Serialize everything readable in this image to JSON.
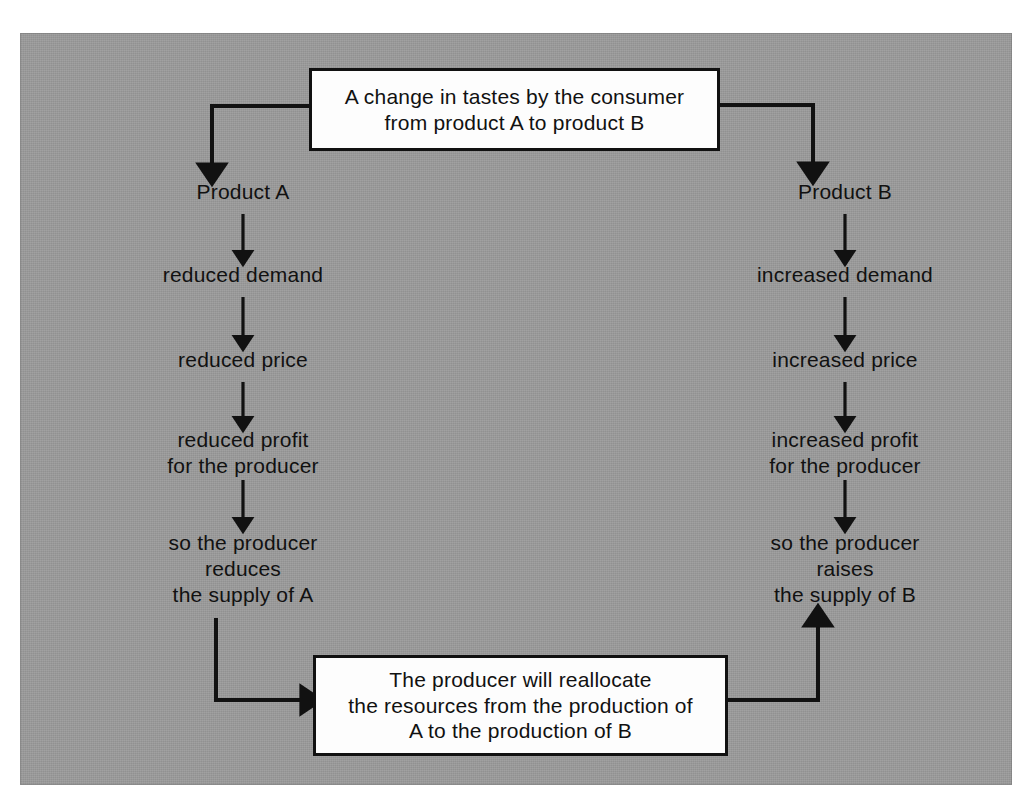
{
  "diagram": {
    "title_box": {
      "id": "change-in-tastes-box",
      "lines": [
        "A change in tastes by the consumer",
        "from product A to product B"
      ]
    },
    "bottom_box": {
      "id": "reallocate-resources-box",
      "lines": [
        "The producer will reallocate",
        "the resources from the production of",
        "A to the production of B"
      ]
    },
    "left_branch": {
      "name": "product-a-branch",
      "nodes": [
        {
          "id": "product-a",
          "text": "Product A"
        },
        {
          "id": "reduced-demand",
          "text": "reduced demand"
        },
        {
          "id": "reduced-price",
          "text": "reduced price"
        },
        {
          "id": "reduced-profit",
          "text": "reduced profit\nfor the producer"
        },
        {
          "id": "producer-reduces-supply",
          "text": "so the producer\nreduces\nthe supply of A"
        }
      ]
    },
    "right_branch": {
      "name": "product-b-branch",
      "nodes": [
        {
          "id": "product-b",
          "text": "Product B"
        },
        {
          "id": "increased-demand",
          "text": "increased demand"
        },
        {
          "id": "increased-price",
          "text": "increased price"
        },
        {
          "id": "increased-profit",
          "text": "increased profit\nfor the producer"
        },
        {
          "id": "producer-raises-supply",
          "text": "so the producer\nraises\nthe supply of B"
        }
      ]
    },
    "connectors": [
      {
        "id": "top-box-to-product-a",
        "direction": "down",
        "arrowhead": true
      },
      {
        "id": "top-box-to-product-b",
        "direction": "down",
        "arrowhead": true
      },
      {
        "id": "product-a-to-reduced-demand",
        "direction": "down",
        "arrowhead": true
      },
      {
        "id": "reduced-demand-to-reduced-price",
        "direction": "down",
        "arrowhead": true
      },
      {
        "id": "reduced-price-to-reduced-profit",
        "direction": "down",
        "arrowhead": true
      },
      {
        "id": "reduced-profit-to-reduces-supply",
        "direction": "down",
        "arrowhead": true
      },
      {
        "id": "product-b-to-increased-demand",
        "direction": "down",
        "arrowhead": true
      },
      {
        "id": "increased-demand-to-increased-price",
        "direction": "down",
        "arrowhead": true
      },
      {
        "id": "increased-price-to-increased-profit",
        "direction": "down",
        "arrowhead": true
      },
      {
        "id": "increased-profit-to-raises-supply",
        "direction": "down",
        "arrowhead": true
      },
      {
        "id": "reduces-supply-to-bottom-box",
        "direction": "right",
        "arrowhead": true
      },
      {
        "id": "bottom-box-to-raises-supply",
        "direction": "up",
        "arrowhead": true
      }
    ],
    "colors": {
      "panel_background": "#9b9b9b",
      "box_fill": "#fdfdfd",
      "ink": "#111111"
    }
  }
}
